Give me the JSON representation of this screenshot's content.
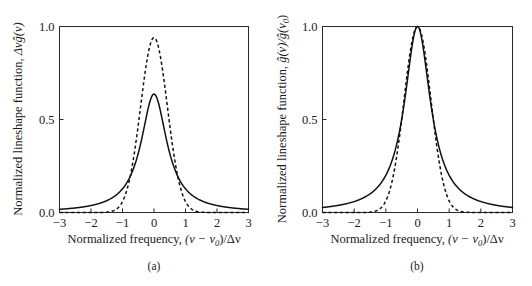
{
  "figure": {
    "background_color": "#ffffff",
    "line_color": "#111111",
    "axis_color": "#2b2b2b"
  },
  "panels": [
    {
      "caption": "(a)",
      "y_axis": {
        "label_prefix": "Normalized lineshape function, ",
        "label_symbol": "Δνĝ(ν)",
        "ticks": [
          "0.0",
          "0.5",
          "1.0"
        ],
        "tick_values": [
          0.0,
          0.5,
          1.0
        ]
      },
      "x_axis": {
        "label_prefix": "Normalized frequency, ",
        "label_symbol": "(ν − ν",
        "label_sub": "0",
        "label_suffix": ")/Δν",
        "ticks": [
          "−3",
          "−2",
          "−1",
          "0",
          "1",
          "2",
          "3"
        ],
        "tick_values": [
          -3,
          -2,
          -1,
          0,
          1,
          2,
          3
        ]
      }
    },
    {
      "caption": "(b)",
      "y_axis": {
        "label_prefix": "Normalized lineshape function, ",
        "label_symbol": "ĝ(ν)/ĝ(ν",
        "label_sub": "0",
        "label_suffix": ")",
        "ticks": [
          "0.0",
          "0.5",
          "1.0"
        ],
        "tick_values": [
          0.0,
          0.5,
          1.0
        ]
      },
      "x_axis": {
        "label_prefix": "Normalized frequency, ",
        "label_symbol": "(ν − ν",
        "label_sub": "0",
        "label_suffix": ")/Δν",
        "ticks": [
          "−3",
          "−2",
          "−1",
          "0",
          "1",
          "2",
          "3"
        ],
        "tick_values": [
          -3,
          -2,
          -1,
          0,
          1,
          2,
          3
        ]
      }
    }
  ],
  "chart_data": [
    {
      "type": "line",
      "title": "",
      "xlabel": "Normalized frequency, (ν − ν0)/Δν",
      "ylabel": "Normalized lineshape function, Δνĝ(ν)",
      "xlim": [
        -3,
        3
      ],
      "ylim": [
        0,
        1
      ],
      "xticks": [
        -3,
        -2,
        -1,
        0,
        1,
        2,
        3
      ],
      "yticks": [
        0.0,
        0.5,
        1.0
      ],
      "grid": false,
      "legend": null,
      "series": [
        {
          "name": "Lorentzian (homogeneous)",
          "style": "solid",
          "peak": 0.6366,
          "fwhm": 1.0,
          "formula": "lorentzian_area_normalized",
          "x": [
            -3,
            -2.75,
            -2.5,
            -2.25,
            -2,
            -1.75,
            -1.5,
            -1.25,
            -1,
            -0.875,
            -0.75,
            -0.625,
            -0.5,
            -0.375,
            -0.25,
            -0.125,
            0,
            0.125,
            0.25,
            0.375,
            0.5,
            0.625,
            0.75,
            0.875,
            1,
            1.25,
            1.5,
            1.75,
            2,
            2.25,
            2.5,
            2.75,
            3
          ],
          "values": [
            0.0173,
            0.0205,
            0.0247,
            0.0303,
            0.0375,
            0.047,
            0.0598,
            0.0771,
            0.1013,
            0.1163,
            0.134,
            0.1549,
            0.1793,
            0.2072,
            0.2379,
            0.2693,
            0.2984,
            0.2693,
            0.2379,
            0.2072,
            0.1793,
            0.1549,
            0.134,
            0.1163,
            0.1013,
            0.0771,
            0.0598,
            0.047,
            0.0375,
            0.0303,
            0.0247,
            0.0205,
            0.0173
          ]
        },
        {
          "name": "Gaussian (inhomogeneous)",
          "style": "dashed",
          "peak": 0.94,
          "fwhm": 1.0,
          "formula": "gaussian_area_normalized",
          "x": [
            -2,
            -1.75,
            -1.5,
            -1.25,
            -1,
            -0.875,
            -0.75,
            -0.625,
            -0.5,
            -0.375,
            -0.25,
            -0.125,
            0,
            0.125,
            0.25,
            0.375,
            0.5,
            0.625,
            0.75,
            0.875,
            1,
            1.25,
            1.5,
            1.75,
            2
          ],
          "values": [
            0.0008,
            0.0041,
            0.0165,
            0.0533,
            0.1392,
            0.2119,
            0.3066,
            0.4212,
            0.55,
            0.6829,
            0.8061,
            0.9042,
            0.94,
            0.9042,
            0.8061,
            0.6829,
            0.55,
            0.4212,
            0.3066,
            0.2119,
            0.1392,
            0.0533,
            0.0165,
            0.0041,
            0.0008
          ]
        }
      ]
    },
    {
      "type": "line",
      "title": "",
      "xlabel": "Normalized frequency, (ν − ν0)/Δν",
      "ylabel": "Normalized lineshape function, ĝ(ν)/ĝ(ν0)",
      "xlim": [
        -3,
        3
      ],
      "ylim": [
        0,
        1
      ],
      "xticks": [
        -3,
        -2,
        -1,
        0,
        1,
        2,
        3
      ],
      "yticks": [
        0.0,
        0.5,
        1.0
      ],
      "grid": false,
      "legend": null,
      "series": [
        {
          "name": "Lorentzian (homogeneous)",
          "style": "solid",
          "peak": 1.0,
          "fwhm": 1.0,
          "formula": "lorentzian_peak_normalized",
          "x": [
            -3,
            -2.75,
            -2.5,
            -2.25,
            -2,
            -1.75,
            -1.5,
            -1.25,
            -1,
            -0.875,
            -0.75,
            -0.625,
            -0.5,
            -0.375,
            -0.25,
            -0.125,
            0,
            0.125,
            0.25,
            0.375,
            0.5,
            0.625,
            0.75,
            0.875,
            1,
            1.25,
            1.5,
            1.75,
            2,
            2.25,
            2.5,
            2.75,
            3
          ],
          "values": [
            0.027,
            0.0321,
            0.0385,
            0.0471,
            0.0588,
            0.0755,
            0.1,
            0.1379,
            0.2,
            0.2462,
            0.3077,
            0.3902,
            0.5,
            0.64,
            0.8,
            0.9412,
            1.0,
            0.9412,
            0.8,
            0.64,
            0.5,
            0.3902,
            0.3077,
            0.2462,
            0.2,
            0.1379,
            0.1,
            0.0755,
            0.0588,
            0.0471,
            0.0385,
            0.0321,
            0.027
          ]
        },
        {
          "name": "Gaussian (inhomogeneous)",
          "style": "dashed",
          "peak": 1.0,
          "fwhm": 1.0,
          "formula": "gaussian_peak_normalized",
          "x": [
            -2,
            -1.75,
            -1.5,
            -1.25,
            -1,
            -0.875,
            -0.75,
            -0.625,
            -0.5,
            -0.375,
            -0.25,
            -0.125,
            0,
            0.125,
            0.25,
            0.375,
            0.5,
            0.625,
            0.75,
            0.875,
            1,
            1.25,
            1.5,
            1.75,
            2
          ],
          "values": [
            0.0009,
            0.0043,
            0.0175,
            0.0567,
            0.1481,
            0.2254,
            0.3262,
            0.4481,
            0.5852,
            0.7266,
            0.8577,
            0.9622,
            1.0,
            0.9622,
            0.8577,
            0.7266,
            0.5852,
            0.4481,
            0.3262,
            0.2254,
            0.1481,
            0.0567,
            0.0175,
            0.0043,
            0.0009
          ]
        }
      ]
    }
  ]
}
